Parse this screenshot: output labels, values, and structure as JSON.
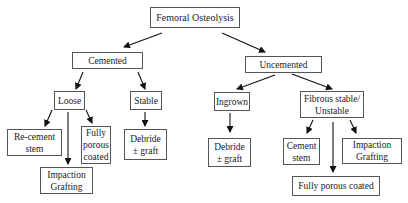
{
  "diagram": {
    "type": "flowchart-tree",
    "nodes": {
      "root": "Femoral Osteolysis",
      "cemented": "Cemented",
      "uncemented": "Uncemented",
      "loose": "Loose",
      "stable": "Stable",
      "ingrown": "Ingrown",
      "fibrous": "Fibrous stable/ Unstable",
      "recement": "Re-cement stem",
      "impaction_left": "Impaction Grafting",
      "fully_porous_left": "Fully porous coated",
      "debride_left": "Debride ± graft",
      "debride_right": "Debride ± graft",
      "cement_stem": "Cement stem",
      "impaction_right": "Impaction Grafting",
      "fully_porous_right": "Fully porous coated"
    },
    "edges": [
      [
        "root",
        "cemented"
      ],
      [
        "root",
        "uncemented"
      ],
      [
        "cemented",
        "loose"
      ],
      [
        "cemented",
        "stable"
      ],
      [
        "uncemented",
        "ingrown"
      ],
      [
        "uncemented",
        "fibrous"
      ],
      [
        "loose",
        "recement"
      ],
      [
        "loose",
        "impaction_left"
      ],
      [
        "loose",
        "fully_porous_left"
      ],
      [
        "stable",
        "debride_left"
      ],
      [
        "ingrown",
        "debride_right"
      ],
      [
        "fibrous",
        "cement_stem"
      ],
      [
        "fibrous",
        "fully_porous_right"
      ],
      [
        "fibrous",
        "impaction_right"
      ]
    ]
  }
}
